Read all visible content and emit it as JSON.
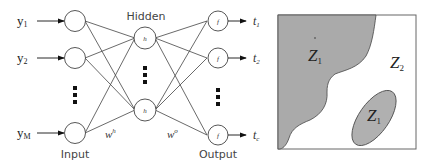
{
  "network": {
    "inputs": [
      {
        "label": "y",
        "sub": "1"
      },
      {
        "label": "y",
        "sub": "2"
      },
      {
        "label": "y",
        "sub": "M"
      }
    ],
    "hidden": [
      {
        "label": "h"
      },
      {
        "label": "h"
      }
    ],
    "outputs": [
      {
        "label": "f",
        "target": "t",
        "sub": "1"
      },
      {
        "label": "f",
        "target": "t",
        "sub": "2"
      },
      {
        "label": "f",
        "target": "t",
        "sub": "c"
      }
    ],
    "layer_labels": {
      "input": "Input",
      "hidden": "Hidden",
      "output": "Output"
    },
    "weights": {
      "hidden": {
        "base": "w",
        "sup": "h"
      },
      "output": {
        "base": "w",
        "sup": "o"
      }
    }
  },
  "regions": {
    "z1_main": {
      "base": "Z",
      "sub": "1"
    },
    "z2": {
      "base": "Z",
      "sub": "2"
    },
    "z1_ellipse": {
      "base": "Z",
      "sub": "1"
    },
    "colors": {
      "region": "#aaaaaa",
      "border": "#555555"
    }
  }
}
